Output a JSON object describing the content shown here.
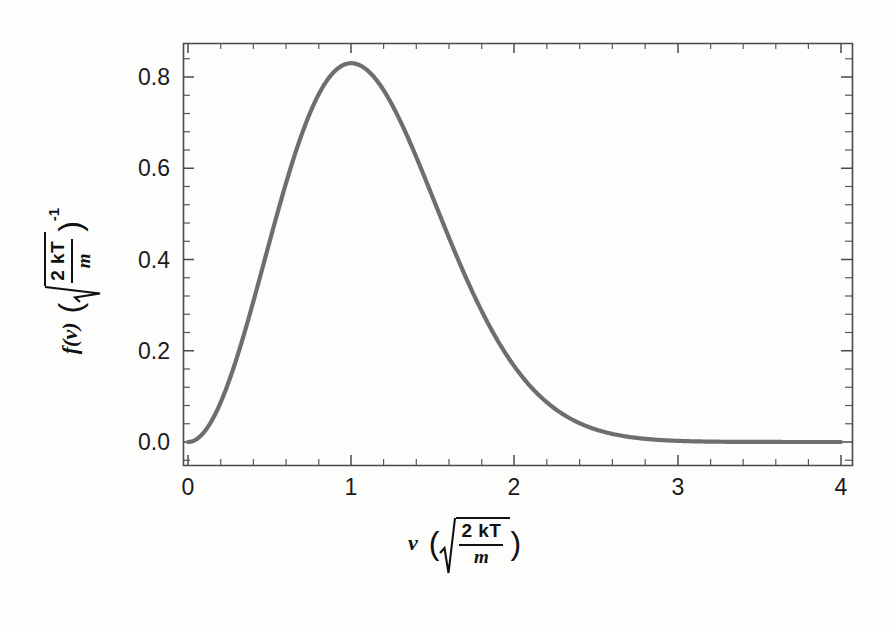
{
  "figure": {
    "background_color": "#fdfdfc",
    "curve_color": "#6e6e6e",
    "axis_color": "#4a4a4a",
    "text_color": "#111111"
  },
  "axis_titles": {
    "x": {
      "variable": "v",
      "open_paren": "(",
      "close_paren": ")",
      "numerator": "2 kT",
      "denominator": "m",
      "exponent": "",
      "plain_text": "v (sqrt(2kT/m))"
    },
    "y": {
      "variable": "f(v)",
      "open_paren": "(",
      "close_paren": ")",
      "numerator": "2 kT",
      "denominator": "m",
      "exponent": "-1",
      "plain_text": "f(v) (sqrt(2kT/m))^-1"
    }
  },
  "chart_data": {
    "type": "line",
    "title": "",
    "subtitle": "",
    "xlabel": "v (sqrt(2kT/m))",
    "ylabel": "f(v) (sqrt(2kT/m))^-1",
    "xlim": [
      -0.06,
      4.08
    ],
    "ylim": [
      -0.035,
      0.872
    ],
    "grid": false,
    "legend": null,
    "x_ticks_major": [
      0,
      1,
      2,
      3,
      4
    ],
    "x_tick_labels": [
      "0",
      "1",
      "2",
      "3",
      "4"
    ],
    "x_minor_per_major": 5,
    "y_ticks_major": [
      0.0,
      0.2,
      0.4,
      0.6,
      0.8
    ],
    "y_tick_labels": [
      "0.0",
      "0.2",
      "0.4",
      "0.6",
      "0.8"
    ],
    "y_minor_per_major": 5,
    "frame": "box",
    "tick_direction": "in",
    "series": [
      {
        "name": "Maxwell-Boltzmann speed distribution",
        "formula": "f(x) = (4/sqrt(pi)) * x^2 * exp(-x^2)",
        "color": "#6e6e6e",
        "linewidth": 4.2,
        "peak_x": 1.0,
        "peak_y": 0.8302,
        "x": [
          0.0,
          0.1,
          0.2,
          0.3,
          0.4,
          0.5,
          0.6,
          0.7,
          0.8,
          0.9,
          1.0,
          1.1,
          1.2,
          1.3,
          1.4,
          1.5,
          1.6,
          1.7,
          1.8,
          1.9,
          2.0,
          2.1,
          2.2,
          2.3,
          2.4,
          2.5,
          2.6,
          2.7,
          2.8,
          2.9,
          3.0,
          3.2,
          3.4,
          3.6,
          3.8,
          4.0
        ],
        "y": [
          0.0,
          0.0223,
          0.0868,
          0.1862,
          0.3079,
          0.4394,
          0.5679,
          0.683,
          0.776,
          0.8415,
          0.8302,
          0.8788,
          0.8498,
          0.7983,
          0.7313,
          0.6547,
          0.5741,
          0.4941,
          0.418,
          0.3482,
          0.286,
          0.2318,
          0.1855,
          0.1467,
          0.1146,
          0.0885,
          0.0676,
          0.051,
          0.0381,
          0.0282,
          0.0206,
          0.0106,
          0.0053,
          0.0025,
          0.0011,
          0.0005
        ]
      }
    ]
  }
}
